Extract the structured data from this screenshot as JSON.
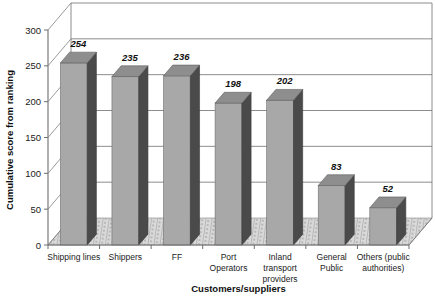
{
  "chart_data": {
    "type": "bar",
    "title": "",
    "xlabel": "Customers/suppliers",
    "ylabel": "Cumulative score from ranking",
    "categories": [
      "Shipping lines",
      "Shippers",
      "FF",
      "Port Operators",
      "Inland transport providers",
      "General Public",
      "Others (public authorities)"
    ],
    "category_lines": [
      [
        "Shipping lines"
      ],
      [
        "Shippers"
      ],
      [
        "FF"
      ],
      [
        "Port",
        "Operators"
      ],
      [
        "Inland",
        "transport",
        "providers"
      ],
      [
        "General",
        "Public"
      ],
      [
        "Others (public",
        "authorities)"
      ]
    ],
    "values": [
      254,
      235,
      236,
      198,
      202,
      83,
      52
    ],
    "value_labels": [
      "254",
      "235",
      "236",
      "198",
      "202",
      "83",
      "52"
    ],
    "ylim": [
      0,
      300
    ],
    "yticks": [
      0,
      50,
      100,
      150,
      200,
      250,
      300
    ],
    "ytick_labels": [
      "0",
      "50",
      "100",
      "150",
      "200",
      "250",
      "300"
    ],
    "grid": true,
    "legend": false,
    "style": "3d-column",
    "colors": {
      "bar_front": "#a8a8a8",
      "bar_side": "#4a4a4a",
      "bar_top": "#8e8e8e",
      "floor": "#d9d9d9",
      "wall": "#ffffff",
      "gridline": "#6e6e6e",
      "axis": "#6e6e6e",
      "text": "#1a1a1a"
    }
  }
}
